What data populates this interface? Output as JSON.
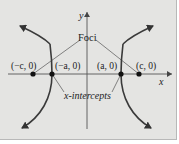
{
  "diagram": {
    "axes": {
      "x_label": "x",
      "y_label": "y"
    },
    "points": [
      {
        "id": "neg-c",
        "label": "(−c, 0)"
      },
      {
        "id": "neg-a",
        "label": "(−a, 0)"
      },
      {
        "id": "pos-a",
        "label": "(a, 0)"
      },
      {
        "id": "pos-c",
        "label": "(c, 0)"
      }
    ],
    "annotations": {
      "foci": "Foci",
      "intercepts": "x-intercepts"
    },
    "colors": {
      "background": "#e4e4e2",
      "curve": "#3a3a3a",
      "line": "#555555"
    }
  }
}
